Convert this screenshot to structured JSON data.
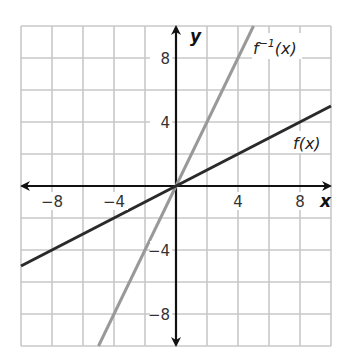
{
  "chart_data": {
    "type": "line",
    "title": "",
    "xlabel": "x",
    "ylabel": "y",
    "xlim": [
      -10,
      10
    ],
    "ylim": [
      -10,
      10
    ],
    "grid": true,
    "grid_step": 2,
    "x_ticks": [
      -8,
      -4,
      4,
      8
    ],
    "y_ticks": [
      8,
      4,
      -4,
      -8
    ],
    "x_tick_labels": [
      "−8",
      "−4",
      "4",
      "8"
    ],
    "y_tick_labels": [
      "8",
      "4",
      "−4",
      "−8"
    ],
    "series": [
      {
        "name": "f(x)",
        "label": "f(x)",
        "color": "#2a2a2a",
        "x": [
          -10,
          10
        ],
        "y": [
          -5,
          5
        ],
        "equation": "y = 0.5x"
      },
      {
        "name": "f^-1(x)",
        "label_base": "f",
        "label_sup": "−1",
        "label_arg": "(x)",
        "color": "#999999",
        "x": [
          -5,
          5
        ],
        "y": [
          -10,
          10
        ],
        "equation": "y = 2x"
      }
    ]
  }
}
